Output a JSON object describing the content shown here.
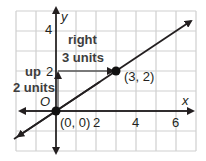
{
  "graph": {
    "axes": {
      "x_label": "x",
      "y_label": "y",
      "origin_label": "O"
    },
    "x_ticks": [
      "2",
      "4",
      "6"
    ],
    "y_ticks": [
      "2",
      "4"
    ],
    "points": [
      {
        "label": "(0, 0)",
        "x": 0,
        "y": 0
      },
      {
        "label": "(3, 2)",
        "x": 3,
        "y": 2
      }
    ],
    "annotations": {
      "rise_line1": "up",
      "rise_line2": "2 units",
      "run_line1": "right",
      "run_line2": "3 units"
    },
    "line": {
      "slope": "2/3",
      "passes_through": [
        "(0, 0)",
        "(3, 2)"
      ]
    },
    "colors": {
      "grid": "#c8c8c8",
      "axis": "#231f20",
      "line": "#231f20"
    }
  }
}
